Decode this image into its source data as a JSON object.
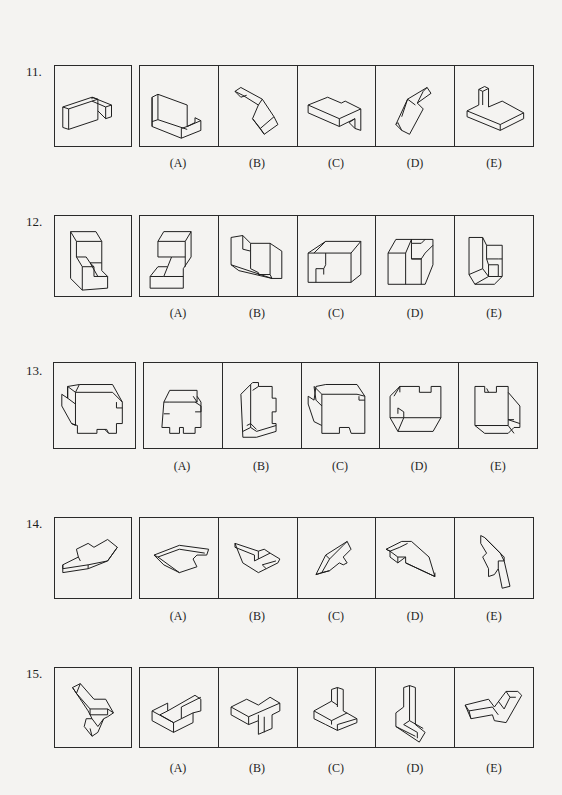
{
  "page": {
    "background": "#f4f3f1",
    "line_color": "#1a1a1a"
  },
  "problems": [
    {
      "number": "11.",
      "question_figure": "l-shaped-block",
      "options": [
        {
          "label": "(A)",
          "figure": "l-bracket-with-back-wall"
        },
        {
          "label": "(B)",
          "figure": "rotated-l-block"
        },
        {
          "label": "(C)",
          "figure": "stepped-slab-with-notch"
        },
        {
          "label": "(D)",
          "figure": "tilted-l-block"
        },
        {
          "label": "(E)",
          "figure": "slab-with-upright-post"
        }
      ]
    },
    {
      "number": "12.",
      "question_figure": "stepped-cube",
      "options": [
        {
          "label": "(A)",
          "figure": "stepped-cube"
        },
        {
          "label": "(B)",
          "figure": "stepped-cube-side-view"
        },
        {
          "label": "(C)",
          "figure": "stepped-cube-notched-front"
        },
        {
          "label": "(D)",
          "figure": "cube-with-recess"
        },
        {
          "label": "(E)",
          "figure": "l-stepped-block"
        }
      ]
    },
    {
      "number": "13.",
      "question_figure": "notched-block",
      "options": [
        {
          "label": "(A)",
          "figure": "narrow-notched-block"
        },
        {
          "label": "(B)",
          "figure": "tall-notched-block"
        },
        {
          "label": "(C)",
          "figure": "notched-block"
        },
        {
          "label": "(D)",
          "figure": "notched-block-flipped"
        },
        {
          "label": "(E)",
          "figure": "notched-block-rotated"
        }
      ]
    },
    {
      "number": "14.",
      "question_figure": "flat-irregular-plate",
      "options": [
        {
          "label": "(A)",
          "figure": "flat-plate-view-a"
        },
        {
          "label": "(B)",
          "figure": "flat-plate-view-b"
        },
        {
          "label": "(C)",
          "figure": "flat-plate-view-c"
        },
        {
          "label": "(D)",
          "figure": "flat-plate-view-d"
        },
        {
          "label": "(E)",
          "figure": "flat-plate-view-e"
        }
      ]
    },
    {
      "number": "15.",
      "question_figure": "bent-l-block-with-triangle",
      "options": [
        {
          "label": "(A)",
          "figure": "l-block-with-step"
        },
        {
          "label": "(B)",
          "figure": "t-shaped-block"
        },
        {
          "label": "(C)",
          "figure": "l-block-with-fin"
        },
        {
          "label": "(D)",
          "figure": "upright-l-block"
        },
        {
          "label": "(E)",
          "figure": "zigzag-block"
        }
      ]
    }
  ]
}
